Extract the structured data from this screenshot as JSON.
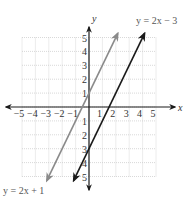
{
  "chart_data": {
    "type": "line",
    "title": "",
    "xlabel": "x",
    "ylabel": "y",
    "xlim": [
      -5,
      5
    ],
    "ylim": [
      -5,
      5
    ],
    "grid": true,
    "x_ticks": [
      "-5",
      "-4",
      "-3",
      "-2",
      "-1",
      "1",
      "2",
      "3",
      "4",
      "5"
    ],
    "y_ticks": [
      "5",
      "4",
      "3",
      "2",
      "1",
      "-1",
      "-2",
      "-3",
      "-4",
      "-5"
    ],
    "series": [
      {
        "name": "y = 2x + 1",
        "equation": "y = 2x + 1",
        "slope": 2,
        "intercept": 1,
        "color": "#8a8a8a",
        "x": [
          -3.15,
          2.15
        ],
        "y": [
          -5.3,
          5.3
        ]
      },
      {
        "name": "y = 2x − 3",
        "equation": "y = 2x − 3",
        "slope": 2,
        "intercept": -3,
        "color": "#1a1a1a",
        "x": [
          -1.15,
          4.15
        ],
        "y": [
          -5.3,
          5.3
        ]
      }
    ],
    "annotations": [
      {
        "text": "y = 2x − 3",
        "position": "top-right"
      },
      {
        "text": "y = 2x + 1",
        "position": "bottom-left"
      }
    ]
  },
  "labels": {
    "x_axis": "x",
    "y_axis": "y",
    "line1": "y = 2x + 1",
    "line2": "y = 2x − 3"
  }
}
